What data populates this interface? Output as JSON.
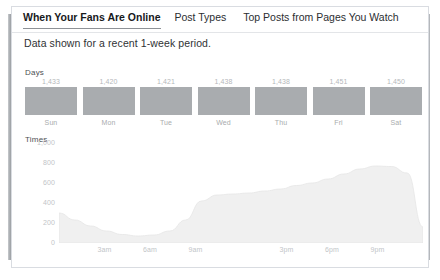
{
  "card": {
    "tabs": [
      {
        "label": "When Your Fans Are Online",
        "active": true
      },
      {
        "label": "Post Types",
        "active": false
      },
      {
        "label": "Top Posts from Pages You Watch",
        "active": false
      }
    ],
    "subtitle": "Data shown for a recent 1-week period.",
    "days_section_label": "Days",
    "times_section_label": "Times",
    "bar_color": "#a9acaf",
    "area_color": "#f0f0f0",
    "border_color": "#d9dce1"
  },
  "chart_data": [
    {
      "type": "bar",
      "title": "Days",
      "xlabel": "",
      "ylabel": "",
      "categories": [
        "Sun",
        "Mon",
        "Tue",
        "Wed",
        "Thu",
        "Fri",
        "Sat"
      ],
      "values": [
        1433,
        1420,
        1421,
        1438,
        1438,
        1451,
        1450
      ],
      "value_labels": [
        "1,433",
        "1,420",
        "1,421",
        "1,438",
        "1,438",
        "1,451",
        "1,450"
      ],
      "grid": false,
      "legend": "none"
    },
    {
      "type": "area",
      "title": "Times",
      "xlabel": "",
      "ylabel": "",
      "ylim": [
        0,
        1000
      ],
      "yticks": [
        1000,
        800,
        600,
        400,
        200,
        0
      ],
      "ytick_labels": [
        "1,000",
        "800",
        "600",
        "400",
        "200",
        "0"
      ],
      "xticks": [
        3,
        6,
        9,
        15,
        18,
        21
      ],
      "xtick_labels": [
        "3am",
        "6am",
        "9am",
        "3pm",
        "6pm",
        "9pm"
      ],
      "x": [
        0,
        1,
        2,
        3,
        4,
        5,
        6,
        7,
        8,
        9,
        10,
        11,
        12,
        13,
        14,
        15,
        16,
        17,
        18,
        19,
        20,
        21,
        22,
        23
      ],
      "values": [
        300,
        230,
        170,
        120,
        85,
        70,
        80,
        120,
        230,
        420,
        480,
        490,
        500,
        520,
        540,
        575,
        600,
        640,
        690,
        740,
        770,
        765,
        700,
        160
      ],
      "grid": false,
      "legend": "none"
    }
  ]
}
